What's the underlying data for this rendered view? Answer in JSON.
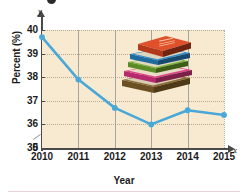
{
  "figure": {
    "y_axis_letter": "y",
    "x_axis_letter": "x",
    "axis_break_glyph": "//",
    "decorative_icons": [
      "book-stack-illustration",
      "cut-off-bullet-marker"
    ]
  },
  "chart_data": {
    "type": "line",
    "title": "",
    "xlabel": "Year",
    "ylabel": "Percent (%)",
    "categories": [
      "2010",
      "2011",
      "2012",
      "2013",
      "2014",
      "2015"
    ],
    "x": [
      2010,
      2011,
      2012,
      2013,
      2014,
      2015
    ],
    "values": [
      39.7,
      37.9,
      36.7,
      36.0,
      36.6,
      36.4
    ],
    "series": [
      {
        "name": "Percent",
        "values": [
          39.7,
          37.9,
          36.7,
          36.0,
          36.6,
          36.4
        ]
      }
    ],
    "ylim": [
      35,
      40
    ],
    "yticks": [
      0,
      35,
      36,
      37,
      38,
      39,
      40
    ],
    "ytick_labels": [
      "0",
      "35",
      "36",
      "37",
      "38",
      "39",
      "40"
    ],
    "xticks": [
      2010,
      2011,
      2012,
      2013,
      2014,
      2015
    ],
    "xtick_labels": [
      "2010",
      "2011",
      "2012",
      "2013",
      "2014",
      "2015"
    ],
    "y_axis_broken": true,
    "grid": true,
    "legend": "none",
    "line_color": "#4aa8d8",
    "marker_color": "#4aa8d8",
    "plot_background": "#f7ead0"
  },
  "books": {
    "top_cover_text": "BOOK",
    "colors": [
      "#e0502a",
      "#2d8fd0",
      "#79b43a",
      "#e0438c",
      "#7a5a2e"
    ]
  }
}
